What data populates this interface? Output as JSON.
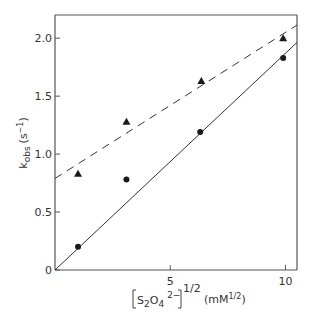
{
  "chart_data": {
    "type": "scatter",
    "title": "",
    "xlabel": "[S2O4 2-]^1/2 (mM^1/2)",
    "ylabel": "k_obs (s^-1)",
    "xlim": [
      0,
      10.5
    ],
    "ylim": [
      0,
      2.2
    ],
    "x_ticks": [
      0,
      5,
      10
    ],
    "x_tick_labels": [
      "",
      "5",
      "10"
    ],
    "y_ticks": [
      0,
      0.5,
      1.0,
      1.5,
      2.0
    ],
    "y_tick_labels": [
      "0",
      "0.5",
      "1.0",
      "1.5",
      "2.0"
    ],
    "grid": false,
    "legend": null,
    "series": [
      {
        "name": "triangles",
        "marker": "triangle",
        "x": [
          1.0,
          3.1,
          6.35,
          9.9
        ],
        "y": [
          0.83,
          1.28,
          1.63,
          2.0
        ],
        "fit_line": {
          "style": "dashed",
          "intercept": 0.79,
          "slope": 0.126
        }
      },
      {
        "name": "circles",
        "marker": "circle",
        "x": [
          1.0,
          3.1,
          6.3,
          9.9
        ],
        "y": [
          0.2,
          0.78,
          1.19,
          1.83
        ],
        "fit_line": {
          "style": "solid",
          "intercept": 0.0,
          "slope": 0.187
        }
      }
    ]
  },
  "labels": {
    "ylabel_main": "k",
    "ylabel_sub": "obs",
    "ylabel_unit": "(s",
    "ylabel_unit_sup": "−1",
    "ylabel_close": ")",
    "xlabel_main": "S",
    "xlabel_sub2": "2",
    "xlabel_o": "O",
    "xlabel_sub4": "4",
    "xlabel_charge": "2−",
    "xlabel_power": "1/2",
    "xlabel_unit": "(mM",
    "xlabel_unit_sup": "1/2",
    "xlabel_unit_close": ")"
  }
}
